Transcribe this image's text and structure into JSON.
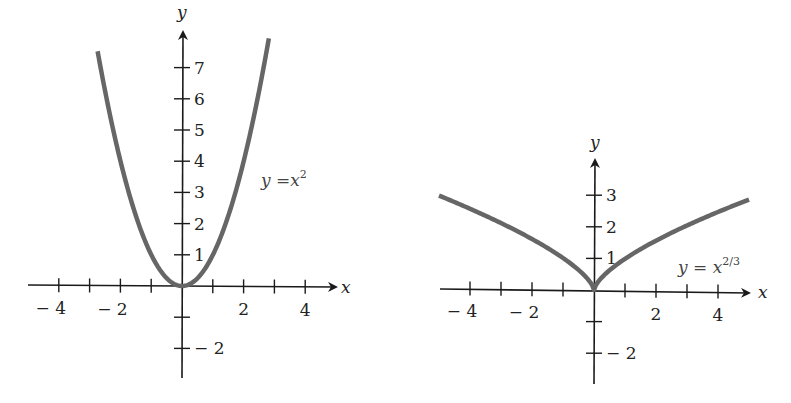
{
  "chart_data": [
    {
      "type": "line",
      "title": "",
      "function": "y = x^2",
      "label": {
        "text": "y =x",
        "sup": "2"
      },
      "xlabel": "x",
      "ylabel": "y",
      "xlim": [
        -5,
        5
      ],
      "ylim": [
        -3,
        8
      ],
      "x_ticks": [
        -4,
        -3,
        -2,
        -1,
        1,
        2,
        3,
        4
      ],
      "x_tick_labels": [
        {
          "value": -4,
          "text": "− 4"
        },
        {
          "value": -2,
          "text": "− 2"
        },
        {
          "value": 2,
          "text": "2"
        },
        {
          "value": 4,
          "text": "4"
        }
      ],
      "y_ticks": [
        -2,
        -1,
        1,
        2,
        3,
        4,
        5,
        6,
        7
      ],
      "y_tick_labels": [
        {
          "value": 7,
          "text": "7"
        },
        {
          "value": 6,
          "text": "6"
        },
        {
          "value": 5,
          "text": "5"
        },
        {
          "value": 4,
          "text": "4"
        },
        {
          "value": 3,
          "text": "3"
        },
        {
          "value": 2,
          "text": "2"
        },
        {
          "value": 1,
          "text": "1"
        },
        {
          "value": -2,
          "text": "− 2"
        }
      ],
      "x": [
        -2.75,
        -2.5,
        -2,
        -1.5,
        -1,
        -0.5,
        0,
        0.5,
        1,
        1.5,
        2,
        2.5,
        2.8
      ],
      "values": [
        7.56,
        6.25,
        4,
        2.25,
        1,
        0.25,
        0,
        0.25,
        1,
        2.25,
        4,
        6.25,
        7.84
      ],
      "grid": false,
      "curve_color": "#666666",
      "axis_color": "#1a1a1a"
    },
    {
      "type": "line",
      "title": "",
      "function": "y = x^(2/3)",
      "label": {
        "text": "y = x",
        "sup": "2/3"
      },
      "xlabel": "x",
      "ylabel": "y",
      "xlim": [
        -5,
        5
      ],
      "ylim": [
        -3,
        4
      ],
      "x_ticks": [
        -4,
        -3,
        -2,
        -1,
        1,
        2,
        3,
        4
      ],
      "x_tick_labels": [
        {
          "value": -4,
          "text": "− 4"
        },
        {
          "value": -2,
          "text": "− 2"
        },
        {
          "value": 2,
          "text": "2"
        },
        {
          "value": 4,
          "text": "4"
        }
      ],
      "y_ticks": [
        -2,
        -1,
        1,
        2,
        3
      ],
      "y_tick_labels": [
        {
          "value": 3,
          "text": "3"
        },
        {
          "value": 2,
          "text": "2"
        },
        {
          "value": 1,
          "text": "1"
        },
        {
          "value": -2,
          "text": "− 2"
        }
      ],
      "x": [
        -5,
        -4,
        -3,
        -2,
        -1,
        0,
        1,
        2,
        3,
        4,
        5
      ],
      "values": [
        2.92,
        2.52,
        2.08,
        1.59,
        1,
        0,
        1,
        1.59,
        2.08,
        2.52,
        2.92
      ],
      "grid": false,
      "curve_color": "#666666",
      "axis_color": "#1a1a1a"
    }
  ]
}
